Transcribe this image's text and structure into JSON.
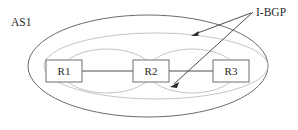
{
  "figure": {
    "background_color": "#ffffff",
    "width": 298,
    "height": 130
  },
  "labels": {
    "as_label": "AS1",
    "ibgp_label": "I-BGP"
  },
  "nodes": [
    {
      "id": "r1",
      "label": "R1",
      "x": 46,
      "y": 60,
      "width": 36,
      "height": 22
    },
    {
      "id": "r2",
      "label": "R2",
      "x": 133,
      "y": 60,
      "width": 36,
      "height": 22
    },
    {
      "id": "r3",
      "label": "R3",
      "x": 213,
      "y": 60,
      "width": 36,
      "height": 22
    }
  ],
  "links": [
    {
      "from": "r1",
      "to": "r2",
      "x1": 82,
      "y1": 71,
      "x2": 133,
      "y2": 71
    },
    {
      "from": "r2",
      "to": "r3",
      "x1": 169,
      "y1": 71,
      "x2": 213,
      "y2": 71
    }
  ],
  "boundary": {
    "name": "as1-boundary",
    "cx": 148,
    "cy": 66,
    "rx": 120,
    "ry": 51,
    "stroke": "#5a5a5a"
  },
  "sessions": [
    {
      "name": "ibgp-session-r1-r3",
      "cx": 156,
      "cy": 66,
      "rx": 112,
      "ry": 33,
      "stroke": "#bdbdbd"
    },
    {
      "name": "ibgp-session-r1-r2",
      "cx": 107,
      "cy": 71,
      "rx": 45,
      "ry": 22,
      "stroke": "#bdbdbd"
    },
    {
      "name": "ibgp-session-r2-r3",
      "cx": 192,
      "cy": 71,
      "rx": 44,
      "ry": 22,
      "stroke": "#bdbdbd"
    }
  ],
  "pointers": [
    {
      "name": "ibgp-pointer-upper",
      "x1": 251,
      "y1": 13,
      "x2": 191,
      "y2": 36
    },
    {
      "name": "ibgp-pointer-lower",
      "x1": 253,
      "y1": 12,
      "x2": 170,
      "y2": 87
    }
  ],
  "colors": {
    "boundary_stroke": "#5a5a5a",
    "session_stroke": "#bdbdbd",
    "box_stroke": "#6e6e6e",
    "link_stroke": "#4a4a4a",
    "text": "#2b2b2b"
  }
}
